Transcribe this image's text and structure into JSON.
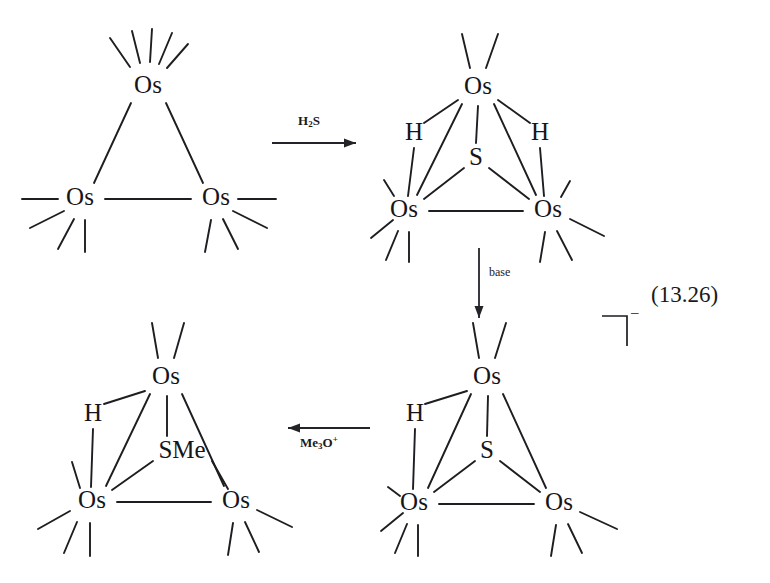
{
  "figure": {
    "equation_number": "(13.26)",
    "charge_label": "–",
    "kind": "reaction-scheme",
    "ink_color": "#1d1d22",
    "background_color": "#ffffff"
  },
  "reagents": {
    "step1": {
      "label_html": "H<sub>2</sub>S",
      "label_text": "H2S",
      "direction": "right"
    },
    "step2": {
      "label_html": "base",
      "label_text": "base",
      "direction": "down"
    },
    "step3": {
      "label_html": "Me<sub>3</sub>O<sup>+</sup>",
      "label_text": "Me3O+",
      "direction": "left"
    }
  },
  "structures": [
    {
      "id": "structure-1",
      "name": "triosmium-cluster",
      "position": "top-left",
      "atoms": [
        {
          "id": "os-top",
          "label": "Os",
          "x": 148,
          "y": 87
        },
        {
          "id": "os-bottom-left",
          "label": "Os",
          "x": 80,
          "y": 199
        },
        {
          "id": "os-bottom-right",
          "label": "Os",
          "x": 216,
          "y": 199
        }
      ],
      "bonds": [
        {
          "from": "os-top",
          "to": "os-bottom-left"
        },
        {
          "from": "os-top",
          "to": "os-bottom-right"
        },
        {
          "from": "os-bottom-left",
          "to": "os-bottom-right"
        }
      ],
      "ligand_counts": {
        "os-top": 5,
        "os-bottom-left": 4,
        "os-bottom-right": 4
      }
    },
    {
      "id": "structure-2",
      "name": "dihydrido-sulfido-triosmium-cluster",
      "position": "top-right",
      "atoms": [
        {
          "id": "os-top",
          "label": "Os",
          "x": 478,
          "y": 88
        },
        {
          "id": "os-bottom-left",
          "label": "Os",
          "x": 404,
          "y": 211
        },
        {
          "id": "os-bottom-right",
          "label": "Os",
          "x": 548,
          "y": 211
        },
        {
          "id": "s-bridge",
          "label": "S",
          "x": 476,
          "y": 159
        },
        {
          "id": "h-left",
          "label": "H",
          "x": 414,
          "y": 134
        },
        {
          "id": "h-right",
          "label": "H",
          "x": 540,
          "y": 134
        }
      ],
      "bonds": [
        {
          "from": "os-top",
          "to": "os-bottom-left"
        },
        {
          "from": "os-top",
          "to": "os-bottom-right"
        },
        {
          "from": "os-bottom-left",
          "to": "os-bottom-right"
        },
        {
          "from": "s-bridge",
          "to": "os-top"
        },
        {
          "from": "s-bridge",
          "to": "os-bottom-left"
        },
        {
          "from": "s-bridge",
          "to": "os-bottom-right"
        },
        {
          "from": "h-left",
          "to": "os-top"
        },
        {
          "from": "h-left",
          "to": "os-bottom-left"
        },
        {
          "from": "h-right",
          "to": "os-top"
        },
        {
          "from": "h-right",
          "to": "os-bottom-right"
        }
      ],
      "ligand_counts": {
        "os-top": 2,
        "os-bottom-left": 4,
        "os-bottom-right": 4
      }
    },
    {
      "id": "structure-3",
      "name": "hydrido-sulfido-triosmium-anion",
      "position": "bottom-right",
      "charged": true,
      "atoms": [
        {
          "id": "os-top",
          "label": "Os",
          "x": 487,
          "y": 378
        },
        {
          "id": "os-bottom-left",
          "label": "Os",
          "x": 414,
          "y": 504
        },
        {
          "id": "os-bottom-right",
          "label": "Os",
          "x": 559,
          "y": 504
        },
        {
          "id": "s-bridge",
          "label": "S",
          "x": 487,
          "y": 452
        },
        {
          "id": "h-left",
          "label": "H",
          "x": 415,
          "y": 415
        }
      ],
      "bonds": [
        {
          "from": "os-top",
          "to": "os-bottom-left"
        },
        {
          "from": "os-top",
          "to": "os-bottom-right"
        },
        {
          "from": "os-bottom-left",
          "to": "os-bottom-right"
        },
        {
          "from": "s-bridge",
          "to": "os-top"
        },
        {
          "from": "s-bridge",
          "to": "os-bottom-left"
        },
        {
          "from": "s-bridge",
          "to": "os-bottom-right"
        },
        {
          "from": "h-left",
          "to": "os-top"
        },
        {
          "from": "h-left",
          "to": "os-bottom-left"
        }
      ],
      "ligand_counts": {
        "os-top": 2,
        "os-bottom-left": 4,
        "os-bottom-right": 4
      }
    },
    {
      "id": "structure-4",
      "name": "hydrido-methylthio-triosmium-cluster",
      "position": "bottom-left",
      "atoms": [
        {
          "id": "os-top",
          "label": "Os",
          "x": 166,
          "y": 378
        },
        {
          "id": "os-bottom-left",
          "label": "Os",
          "x": 92,
          "y": 502
        },
        {
          "id": "os-bottom-right",
          "label": "Os",
          "x": 236,
          "y": 502
        },
        {
          "id": "s-bridge",
          "label": "SMe",
          "x": 182,
          "y": 452
        },
        {
          "id": "h-left",
          "label": "H",
          "x": 93,
          "y": 415
        }
      ],
      "bonds": [
        {
          "from": "os-top",
          "to": "os-bottom-left"
        },
        {
          "from": "os-top",
          "to": "os-bottom-right"
        },
        {
          "from": "os-bottom-left",
          "to": "os-bottom-right"
        },
        {
          "from": "s-bridge",
          "to": "os-top"
        },
        {
          "from": "s-bridge",
          "to": "os-bottom-left"
        },
        {
          "from": "s-bridge",
          "to": "os-bottom-right"
        },
        {
          "from": "h-left",
          "to": "os-top"
        },
        {
          "from": "h-left",
          "to": "os-bottom-left"
        }
      ],
      "ligand_counts": {
        "os-top": 2,
        "os-bottom-left": 4,
        "os-bottom-right": 4
      }
    }
  ],
  "labels": {
    "os": "Os",
    "s": "S",
    "sme": "SMe",
    "h": "H"
  }
}
